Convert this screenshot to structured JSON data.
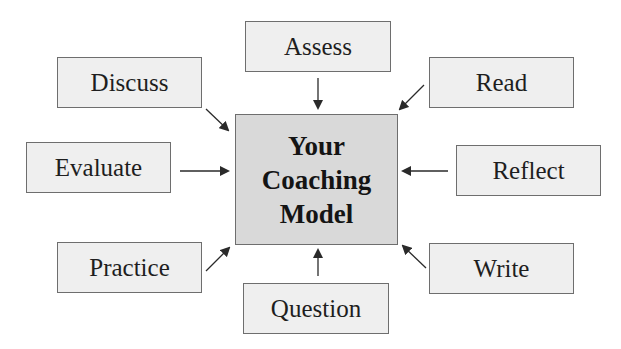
{
  "center": {
    "lines": [
      "Your",
      "Coaching",
      "Model"
    ],
    "fill": "#d9d9d9"
  },
  "nodes": {
    "assess": "Assess",
    "discuss": "Discuss",
    "read": "Read",
    "evaluate": "Evaluate",
    "reflect": "Reflect",
    "practice": "Practice",
    "write": "Write",
    "question": "Question"
  },
  "colors": {
    "node_fill": "#efefef",
    "border": "#6e6e6e",
    "arrow": "#2a2a2a"
  }
}
